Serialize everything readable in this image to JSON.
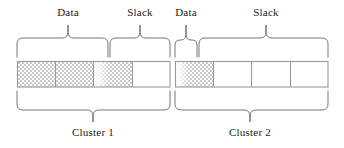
{
  "figure": {
    "title": "",
    "type": "disk-cluster-allocation-diagram"
  },
  "top_labels": [
    {
      "id": "data-1",
      "text": "Data",
      "center_x": 68,
      "y": 6
    },
    {
      "id": "slack-1",
      "text": "Slack",
      "center_x": 140,
      "y": 6
    },
    {
      "id": "data-2",
      "text": "Data",
      "center_x": 186,
      "y": 6
    },
    {
      "id": "slack-2",
      "text": "Slack",
      "center_x": 266,
      "y": 6
    }
  ],
  "bottom_labels": [
    {
      "id": "cluster-1",
      "text": "Cluster 1",
      "center_x": 93,
      "y": 128
    },
    {
      "id": "cluster-2",
      "text": "Cluster 2",
      "center_x": 250,
      "y": 128
    }
  ],
  "top_braces": [
    {
      "id": "brace-data-1",
      "x0": 17,
      "x1": 108,
      "tip_x": 68,
      "label": "Data"
    },
    {
      "id": "brace-slack-1",
      "x0": 110,
      "x1": 170,
      "tip_x": 140,
      "label": "Slack"
    },
    {
      "id": "brace-data-2",
      "x0": 175,
      "x1": 197,
      "tip_x": 186,
      "label": "Data"
    },
    {
      "id": "brace-slack-2",
      "x0": 199,
      "x1": 328,
      "tip_x": 266,
      "label": "Slack"
    }
  ],
  "bottom_braces": [
    {
      "id": "brace-cluster-1",
      "x0": 17,
      "x1": 170,
      "tip_x": 93,
      "label": "Cluster 1"
    },
    {
      "id": "brace-cluster-2",
      "x0": 175,
      "x1": 328,
      "tip_x": 250,
      "label": "Cluster 2"
    }
  ],
  "clusters": [
    {
      "id": "cluster-1",
      "label": "Cluster 1",
      "x": 17,
      "width": 153,
      "cells": [
        {
          "index": 0,
          "x": 17,
          "width": 38,
          "fill": "data",
          "fill_fraction": 1.0
        },
        {
          "index": 1,
          "x": 55,
          "width": 38,
          "fill": "data",
          "fill_fraction": 1.0
        },
        {
          "index": 2,
          "x": 93,
          "width": 39,
          "fill": "data",
          "fill_fraction": 0.62
        },
        {
          "index": 3,
          "x": 132,
          "width": 38,
          "fill": "slack",
          "fill_fraction": 0.0
        }
      ]
    },
    {
      "id": "cluster-2",
      "label": "Cluster 2",
      "x": 175,
      "width": 153,
      "cells": [
        {
          "index": 0,
          "x": 175,
          "width": 38,
          "fill": "data",
          "fill_fraction": 0.72
        },
        {
          "index": 1,
          "x": 213,
          "width": 38,
          "fill": "slack",
          "fill_fraction": 0.0
        },
        {
          "index": 2,
          "x": 251,
          "width": 39,
          "fill": "slack",
          "fill_fraction": 0.0
        },
        {
          "index": 3,
          "x": 290,
          "width": 38,
          "fill": "slack",
          "fill_fraction": 0.0
        }
      ]
    }
  ],
  "geometry": {
    "box_top": 61,
    "box_bottom": 87,
    "top_brace_top": 24,
    "top_brace_bottom": 57,
    "bottom_brace_top": 91,
    "bottom_brace_bottom": 122
  },
  "colors": {
    "stroke": "#8a8a8a",
    "cell_stroke": "#9a9a9a",
    "brace_stroke": "#5a5a5a",
    "data_fill": "#d8d8d8",
    "slack_fill": "#ffffff",
    "text": "#1a1a1a",
    "background": "#ffffff"
  }
}
